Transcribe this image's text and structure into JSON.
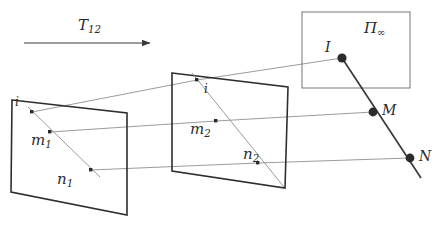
{
  "figure": {
    "title_arrow": {
      "label": "T",
      "label_sub": "12",
      "arrow_name": "transformation-arrow"
    },
    "planes": [
      {
        "id": "plane-1",
        "labels": [
          {
            "name": "point-label-i-1",
            "text": "i",
            "sub": "",
            "x": 15,
            "y": 97,
            "size": "sz-small"
          },
          {
            "name": "point-label-m1",
            "text": "m",
            "sub": "1",
            "x": 31,
            "y": 134,
            "size": "sz-plane"
          },
          {
            "name": "point-label-n1",
            "text": "n",
            "sub": "1",
            "x": 57,
            "y": 173,
            "size": "sz-plane"
          }
        ]
      },
      {
        "id": "plane-2",
        "labels": [
          {
            "name": "point-label-i-2",
            "text": "i",
            "sub": "",
            "x": 203,
            "y": 84,
            "size": "sz-small"
          },
          {
            "name": "point-label-m2",
            "text": "m",
            "sub": "2",
            "x": 190,
            "y": 123,
            "size": "sz-plane"
          },
          {
            "name": "point-label-n2",
            "text": "n",
            "sub": "2",
            "x": 243,
            "y": 148,
            "size": "sz-plane"
          }
        ]
      }
    ],
    "plane_infinity": {
      "name": "plane-at-infinity-box",
      "label": "Π",
      "label_sub": "∞",
      "label_x": 364,
      "label_y": 22
    },
    "space_points": [
      {
        "name": "point-label-I",
        "text": "I",
        "x": 325,
        "y": 41,
        "size": "sz-pt"
      },
      {
        "name": "point-label-M",
        "text": "M",
        "x": 382,
        "y": 104,
        "size": "sz-pt"
      },
      {
        "name": "point-label-N",
        "text": "N",
        "x": 419,
        "y": 150,
        "size": "sz-pt"
      }
    ],
    "colors": {
      "plane_stroke": "#2e2e2e",
      "ray_stroke": "#8a8a8a",
      "heavy_stroke": "#3a3a3a",
      "box_stroke": "#6f6f6f",
      "dot_fill": "#2b2b2b",
      "background": "#ffffff",
      "text": "#2b2b2b"
    },
    "geometry": {
      "plane1_polygon": "12,100 127,113 127,215 11,192",
      "plane2_polygon": "172,73 288,87 285,188 172,171",
      "infinity_rect": {
        "x": 302,
        "y": 12,
        "w": 108,
        "h": 76
      },
      "arrow": {
        "x1": 24,
        "y1": 43,
        "x2": 150,
        "y2": 43
      },
      "plane1_dots": [
        [
          32,
          112
        ],
        [
          50,
          132
        ],
        [
          91,
          170
        ]
      ],
      "plane2_dots": [
        [
          197,
          80
        ],
        [
          216,
          121
        ],
        [
          258,
          163
        ]
      ],
      "space_dots": [
        [
          342,
          58
        ],
        [
          373,
          112
        ],
        [
          410,
          158
        ]
      ],
      "plane1_inner_line": "28,108 99,176",
      "plane2_inner_line": "193,74 283,186",
      "rays": [
        "32,112 197,80",
        "32,112 342,58",
        "50,132 216,121",
        "50,132 373,112",
        "91,170 258,163",
        "91,170 410,158"
      ],
      "space_line": "342,58 420,176"
    }
  }
}
